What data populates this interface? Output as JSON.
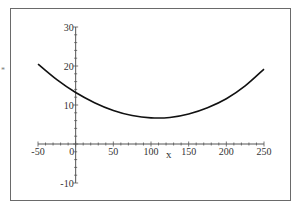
{
  "chart_data": {
    "type": "line",
    "title": "",
    "xlabel": "x",
    "ylabel": "*",
    "xlim": [
      -50,
      250
    ],
    "ylim": [
      -10,
      30
    ],
    "x_ticks": [
      -50,
      0,
      50,
      100,
      150,
      200,
      250
    ],
    "y_ticks": [
      -10,
      10,
      20,
      30
    ],
    "grid": false,
    "legend": null,
    "series": [
      {
        "name": "curve",
        "color": "#111111",
        "x": [
          -50,
          -25,
          0,
          25,
          50,
          75,
          100,
          125,
          150,
          175,
          200,
          225,
          250
        ],
        "y": [
          20.5,
          16.5,
          13.2,
          10.6,
          8.6,
          7.3,
          6.7,
          6.8,
          7.7,
          9.3,
          11.6,
          14.9,
          19.2
        ]
      }
    ]
  }
}
